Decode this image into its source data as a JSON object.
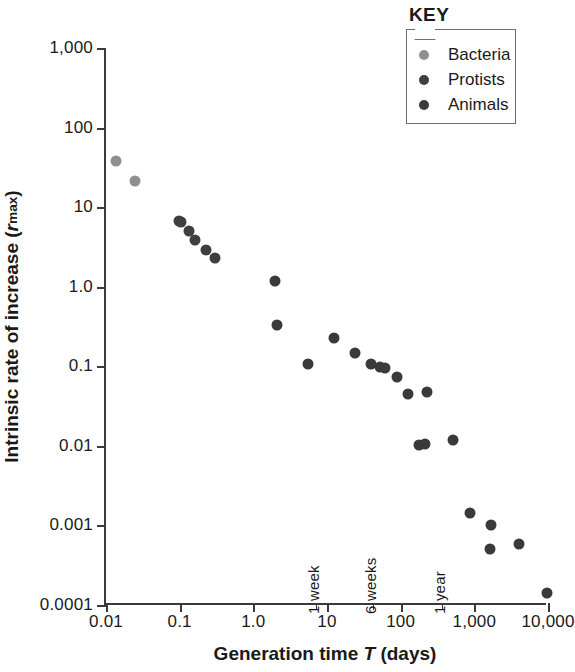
{
  "chart_data": {
    "type": "scatter",
    "title": "",
    "xlabel": "Generation time T (days)",
    "ylabel": "Intrinsic rate of increase (rmax)",
    "xscale": "log",
    "yscale": "log",
    "xlim": [
      0.01,
      10000
    ],
    "ylim": [
      0.0001,
      1000
    ],
    "grid": false,
    "legend_position": "top-right",
    "xticks": [
      "0.01",
      "0.1",
      "1.0",
      "10",
      "100",
      "1,000",
      "10,000"
    ],
    "xtick_values": [
      0.01,
      0.1,
      1.0,
      10,
      100,
      1000,
      10000
    ],
    "yticks": [
      "1,000",
      "100",
      "10",
      "1.0",
      "0.1",
      "0.01",
      "0.001",
      "0.0001"
    ],
    "ytick_values": [
      1000,
      100,
      10,
      1.0,
      0.1,
      0.01,
      0.001,
      0.0001
    ],
    "annotations": [
      {
        "text": "1 week",
        "x": 7,
        "rotation": -90
      },
      {
        "text": "6 weeks",
        "x": 42,
        "rotation": -90
      },
      {
        "text": "1 year",
        "x": 365,
        "rotation": -90
      }
    ],
    "series": [
      {
        "name": "Bacteria",
        "color": "#8f8f8f",
        "points": [
          {
            "x": 0.0137,
            "y": 38.0
          },
          {
            "x": 0.0245,
            "y": 21.5
          }
        ]
      },
      {
        "name": "Protists",
        "color": "#3f3f3f",
        "points": [
          {
            "x": 0.105,
            "y": 6.6
          },
          {
            "x": 0.132,
            "y": 5.0
          },
          {
            "x": 0.163,
            "y": 3.9
          },
          {
            "x": 0.225,
            "y": 2.9
          },
          {
            "x": 0.305,
            "y": 2.3
          },
          {
            "x": 0.098,
            "y": 6.7
          }
        ]
      },
      {
        "name": "Animals",
        "color": "#3a3a3a",
        "points": [
          {
            "x": 1.95,
            "y": 1.18
          },
          {
            "x": 2.1,
            "y": 0.33
          },
          {
            "x": 5.6,
            "y": 0.107
          },
          {
            "x": 12.5,
            "y": 0.225
          },
          {
            "x": 24.0,
            "y": 0.145
          },
          {
            "x": 40.0,
            "y": 0.108
          },
          {
            "x": 53.0,
            "y": 0.097
          },
          {
            "x": 62.0,
            "y": 0.094
          },
          {
            "x": 88.0,
            "y": 0.073
          },
          {
            "x": 125.0,
            "y": 0.045
          },
          {
            "x": 230.0,
            "y": 0.047
          },
          {
            "x": 175.0,
            "y": 0.0103
          },
          {
            "x": 215.0,
            "y": 0.0105
          },
          {
            "x": 520.0,
            "y": 0.012
          },
          {
            "x": 880.0,
            "y": 0.00145
          },
          {
            "x": 1700.0,
            "y": 0.001
          },
          {
            "x": 1650.0,
            "y": 0.0005
          },
          {
            "x": 4100.0,
            "y": 0.00058
          },
          {
            "x": 9700.0,
            "y": 0.00014
          }
        ]
      }
    ]
  },
  "legend": {
    "title": "KEY",
    "items": [
      {
        "label": "Bacteria",
        "color": "#8f8f8f"
      },
      {
        "label": "Protists",
        "color": "#3f3f3f"
      },
      {
        "label": "Animals",
        "color": "#3a3a3a"
      }
    ]
  },
  "axis_titles": {
    "y_prefix": "Intrinsic rate of increase (",
    "y_italic": "r",
    "y_sub": "max",
    "y_suffix": ")",
    "x_prefix": "Generation time ",
    "x_italic": "T",
    "x_suffix": " (days)"
  }
}
